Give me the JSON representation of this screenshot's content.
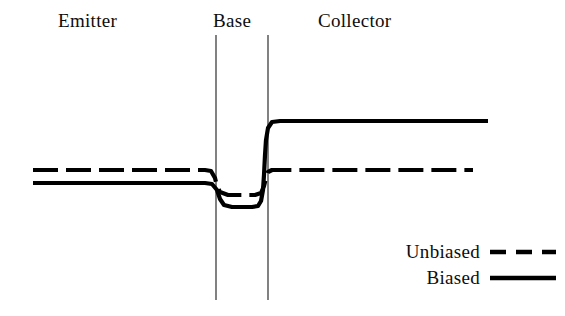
{
  "figure": {
    "background_color": "#ffffff",
    "line_color": "#000000"
  },
  "regions": [
    {
      "key": "emitter",
      "label": "Emitter",
      "label_x": 58,
      "label_y": 10
    },
    {
      "key": "base",
      "label": "Base",
      "label_x": 213,
      "label_y": 10
    },
    {
      "key": "collector",
      "label": "Collector",
      "label_x": 318,
      "label_y": 10
    }
  ],
  "boundaries": {
    "left_junction_x": 216,
    "right_junction_x": 268,
    "top_y": 35,
    "bottom_y": 300
  },
  "legend": {
    "position": "bottom-right",
    "items": [
      {
        "key": "unbiased",
        "label": "Unbiased",
        "style": "dashed",
        "dash": "16 10"
      },
      {
        "key": "biased",
        "label": "Biased",
        "style": "solid",
        "dash": ""
      }
    ]
  },
  "chart_data": {
    "type": "line",
    "title": "",
    "xlabel": "",
    "ylabel": "",
    "xlim": [
      0,
      565
    ],
    "ylim": [
      316,
      0
    ],
    "grid": false,
    "legend_position": "bottom-right",
    "axis_note": "Energy increases upward; horizontal axis is position through the device",
    "series": [
      {
        "name": "Unbiased",
        "style": "dashed",
        "description": "Flat level across emitter, small dip through the base, flat again across collector (same level both sides)",
        "points": [
          [
            33,
            170
          ],
          [
            205,
            170
          ],
          [
            211,
            171
          ],
          [
            215,
            178
          ],
          [
            217,
            186
          ],
          [
            220,
            192
          ],
          [
            228,
            195
          ],
          [
            255,
            195
          ],
          [
            261,
            193
          ],
          [
            264,
            186
          ],
          [
            266,
            178
          ],
          [
            268,
            172
          ],
          [
            272,
            170
          ],
          [
            473,
            170
          ]
        ]
      },
      {
        "name": "Biased",
        "style": "solid",
        "description": "Emitter level low-flat, deep well in the base, then steps up to a high flat collector level",
        "points": [
          [
            33,
            183
          ],
          [
            205,
            183
          ],
          [
            212,
            184
          ],
          [
            217,
            190
          ],
          [
            220,
            199
          ],
          [
            224,
            205
          ],
          [
            232,
            207
          ],
          [
            252,
            207
          ],
          [
            258,
            206
          ],
          [
            261,
            201
          ],
          [
            263,
            190
          ],
          [
            264,
            175
          ],
          [
            265,
            155
          ],
          [
            266,
            140
          ],
          [
            268,
            128
          ],
          [
            272,
            122
          ],
          [
            280,
            121
          ],
          [
            488,
            121
          ]
        ]
      }
    ]
  }
}
